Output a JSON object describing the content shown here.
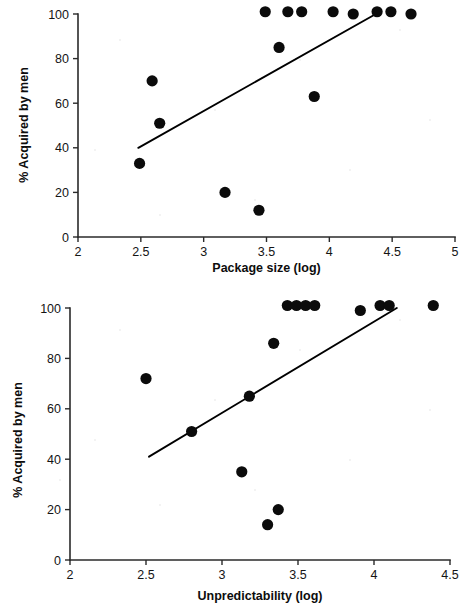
{
  "chart_data": [
    {
      "id": "package-size",
      "type": "scatter",
      "title": "",
      "xlabel": "Package size (log)",
      "ylabel": "% Acquired by men",
      "xlim": [
        2,
        5
      ],
      "ylim": [
        0,
        100
      ],
      "xticks": [
        2,
        2.5,
        3,
        3.5,
        4,
        4.5,
        5
      ],
      "xticklabels": [
        "2",
        "2.5",
        "3",
        "3.5",
        "4",
        "4.5",
        "5"
      ],
      "yticks": [
        0,
        20,
        40,
        60,
        80,
        100
      ],
      "yticklabels": [
        "0",
        "20",
        "40",
        "60",
        "80",
        "100"
      ],
      "grid": false,
      "legend": false,
      "marker": "filled-circle",
      "points": [
        {
          "x": 2.49,
          "y": 33
        },
        {
          "x": 2.59,
          "y": 70
        },
        {
          "x": 2.65,
          "y": 51
        },
        {
          "x": 3.17,
          "y": 20
        },
        {
          "x": 3.44,
          "y": 12
        },
        {
          "x": 3.49,
          "y": 101
        },
        {
          "x": 3.6,
          "y": 85
        },
        {
          "x": 3.67,
          "y": 101
        },
        {
          "x": 3.78,
          "y": 101
        },
        {
          "x": 3.88,
          "y": 63
        },
        {
          "x": 4.03,
          "y": 101
        },
        {
          "x": 4.19,
          "y": 100
        },
        {
          "x": 4.38,
          "y": 101
        },
        {
          "x": 4.49,
          "y": 101
        },
        {
          "x": 4.65,
          "y": 100
        }
      ],
      "trendline": {
        "x1": 2.48,
        "y1": 40,
        "x2": 4.37,
        "y2": 100
      }
    },
    {
      "id": "unpredictability",
      "type": "scatter",
      "title": "",
      "xlabel": "Unpredictability (log)",
      "ylabel": "% Acquired by men",
      "xlim": [
        2,
        4.5
      ],
      "ylim": [
        0,
        100
      ],
      "xticks": [
        2,
        2.5,
        3,
        3.5,
        4,
        4.5
      ],
      "xticklabels": [
        "2",
        "2.5",
        "3",
        "3.5",
        "4",
        "4.5"
      ],
      "yticks": [
        0,
        20,
        40,
        60,
        80,
        100
      ],
      "yticklabels": [
        "0",
        "20",
        "40",
        "60",
        "80",
        "100"
      ],
      "grid": false,
      "legend": false,
      "marker": "filled-circle",
      "points": [
        {
          "x": 2.5,
          "y": 72
        },
        {
          "x": 2.8,
          "y": 51
        },
        {
          "x": 3.13,
          "y": 35
        },
        {
          "x": 3.18,
          "y": 65
        },
        {
          "x": 3.3,
          "y": 14
        },
        {
          "x": 3.34,
          "y": 86
        },
        {
          "x": 3.37,
          "y": 20
        },
        {
          "x": 3.43,
          "y": 101
        },
        {
          "x": 3.49,
          "y": 101
        },
        {
          "x": 3.55,
          "y": 101
        },
        {
          "x": 3.61,
          "y": 101
        },
        {
          "x": 3.91,
          "y": 99
        },
        {
          "x": 4.04,
          "y": 101
        },
        {
          "x": 4.1,
          "y": 101
        },
        {
          "x": 4.39,
          "y": 101
        }
      ],
      "trendline": {
        "x1": 2.52,
        "y1": 41,
        "x2": 4.15,
        "y2": 100
      }
    }
  ]
}
